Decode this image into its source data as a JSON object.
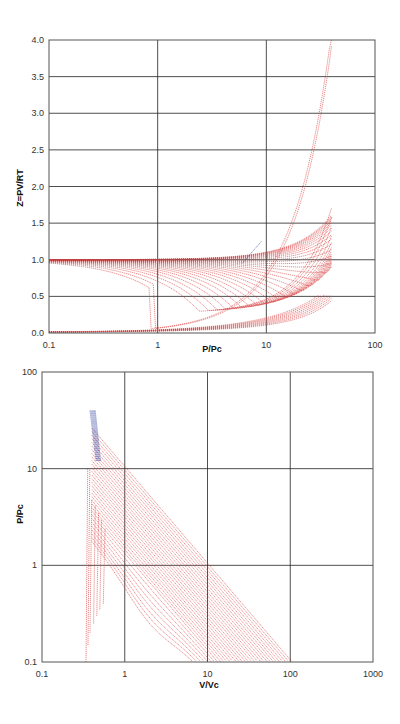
{
  "chart_data": [
    {
      "id": "z-chart",
      "type": "line",
      "title": "",
      "xlabel": "P/Pc",
      "ylabel": "Z=PV/RT",
      "xscale": "log",
      "xlim": [
        0.1,
        100
      ],
      "ylim": [
        0.0,
        4.0
      ],
      "xticks": [
        "0.1",
        "1",
        "10",
        "100"
      ],
      "yticks": [
        "0.0",
        "0.5",
        "1.0",
        "1.5",
        "2.0",
        "2.5",
        "3.0",
        "3.5",
        "4.0"
      ],
      "grid": true,
      "legend": "none",
      "series_colors": {
        "isotherms": "#d83a3a",
        "saturation": "#2a3a9a"
      },
      "description": "Family of reduced isotherms: vapor branches start near Z=1.0 at P/Pc=0.1 and decline; liquid branch starts near Z=0.0 and rises; all converge near P/Pc≈8-10, Z≈1.2 then fan out to Z between ~1.5 and 4.0 at P/Pc≈40.",
      "series": [
        {
          "name": "Tr low (liquid)",
          "x": [
            0.1,
            0.3,
            1,
            3,
            8,
            15,
            25,
            40
          ],
          "y": [
            0.02,
            0.05,
            0.15,
            0.45,
            1.1,
            1.9,
            2.9,
            4.0
          ]
        },
        {
          "name": "Tr ~1.0",
          "x": [
            0.1,
            0.3,
            0.7,
            1.0,
            1.2,
            3,
            8,
            15,
            25,
            40
          ],
          "y": [
            0.97,
            0.9,
            0.72,
            0.3,
            0.25,
            0.5,
            1.1,
            1.8,
            2.6,
            3.6
          ]
        },
        {
          "name": "Tr ~1.2",
          "x": [
            0.1,
            0.5,
            1,
            2,
            4,
            8,
            15,
            25,
            40
          ],
          "y": [
            0.98,
            0.92,
            0.82,
            0.6,
            0.7,
            1.15,
            1.6,
            2.2,
            3.0
          ]
        },
        {
          "name": "Tr ~1.5",
          "x": [
            0.1,
            1,
            3,
            6,
            9,
            15,
            25,
            40
          ],
          "y": [
            0.99,
            0.92,
            0.8,
            0.95,
            1.2,
            1.45,
            1.8,
            2.3
          ]
        },
        {
          "name": "Tr ~2.0",
          "x": [
            0.1,
            1,
            3,
            6,
            9,
            15,
            25,
            40
          ],
          "y": [
            1.0,
            0.97,
            0.95,
            1.05,
            1.2,
            1.35,
            1.5,
            1.75
          ]
        },
        {
          "name": "Tr high",
          "x": [
            0.1,
            1,
            5,
            9,
            15,
            25,
            40
          ],
          "y": [
            1.0,
            1.0,
            1.05,
            1.15,
            1.25,
            1.35,
            1.5
          ]
        }
      ]
    },
    {
      "id": "pv-chart",
      "type": "line",
      "title": "",
      "xlabel": "V/Vc",
      "ylabel": "P/Pc",
      "xscale": "log",
      "yscale": "log",
      "xlim": [
        0.1,
        1000
      ],
      "ylim": [
        0.1,
        100
      ],
      "xticks": [
        "0.1",
        "1",
        "10",
        "100",
        "1000"
      ],
      "yticks": [
        "0.1",
        "1",
        "10",
        "100"
      ],
      "grid": true,
      "legend": "none",
      "series_colors": {
        "isotherms": "#d83a3a",
        "saturation": "#2a3a9a"
      },
      "description": "Reduced P-V isotherms on log-log axes: near-vertical liquid lines at V/Vc≈0.35-0.5, isotherms starting at P/Pc=40 and descending diagonally; lowest curves reach P/Pc=0.1 at V/Vc≈30-40, highest at V/Vc≈500.",
      "series": [
        {
          "name": "liquid line",
          "x": [
            0.35,
            0.36,
            0.38,
            0.4
          ],
          "y": [
            0.1,
            1,
            10,
            40
          ]
        },
        {
          "name": "Tr ~1.0",
          "x": [
            0.42,
            0.5,
            0.8,
            1.0,
            2,
            5,
            10,
            20,
            35
          ],
          "y": [
            40,
            10,
            3,
            1.05,
            0.95,
            0.6,
            0.35,
            0.18,
            0.1
          ]
        },
        {
          "name": "Tr ~1.5",
          "x": [
            0.45,
            0.6,
            1,
            2,
            5,
            10,
            20,
            45
          ],
          "y": [
            40,
            10,
            4,
            2,
            0.8,
            0.42,
            0.21,
            0.1
          ]
        },
        {
          "name": "Tr ~3",
          "x": [
            0.6,
            1,
            3,
            10,
            30,
            70
          ],
          "y": [
            40,
            15,
            4,
            1.2,
            0.35,
            0.14
          ]
        },
        {
          "name": "Tr ~6",
          "x": [
            1.2,
            3,
            10,
            30,
            100,
            200
          ],
          "y": [
            40,
            15,
            4.5,
            1.5,
            0.45,
            0.2
          ]
        },
        {
          "name": "Tr ~12",
          "x": [
            2.2,
            10,
            30,
            100,
            300,
            500
          ],
          "y": [
            40,
            9,
            3,
            0.9,
            0.3,
            0.18
          ]
        }
      ]
    }
  ],
  "charts": {
    "z": {
      "xlabel": "P/Pc",
      "ylabel": "Z=PV/RT",
      "xticks": [
        "0.1",
        "1",
        "10",
        "100"
      ],
      "yticks": [
        "0.0",
        "0.5",
        "1.0",
        "1.5",
        "2.0",
        "2.5",
        "3.0",
        "3.5",
        "4.0"
      ]
    },
    "pv": {
      "xlabel": "V/Vc",
      "ylabel": "P/Pc",
      "xticks": [
        "0.1",
        "1",
        "10",
        "100",
        "1000"
      ],
      "yticks": [
        "0.1",
        "1",
        "10",
        "100"
      ]
    }
  }
}
